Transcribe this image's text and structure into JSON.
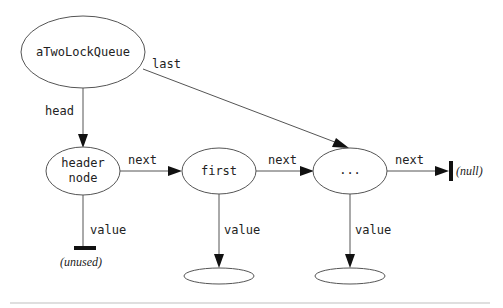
{
  "diagram": {
    "nodes": {
      "queue": {
        "label": "aTwoLockQueue"
      },
      "header": {
        "label_line1": "header",
        "label_line2": "node"
      },
      "first": {
        "label": "first"
      },
      "ellipsis": {
        "label": "..."
      },
      "first_value": {
        "label": ""
      },
      "ellipsis_value": {
        "label": ""
      }
    },
    "edges": {
      "head": {
        "label": "head"
      },
      "last": {
        "label": "last"
      },
      "header_next": {
        "label": "next"
      },
      "first_next": {
        "label": "next"
      },
      "ellipsis_next": {
        "label": "next"
      },
      "header_value": {
        "label": "value"
      },
      "first_value": {
        "label": "value"
      },
      "ellipsis_value": {
        "label": "value"
      }
    },
    "terminals": {
      "unused": {
        "label": "(unused)"
      },
      "null": {
        "label": "(null)"
      }
    }
  }
}
